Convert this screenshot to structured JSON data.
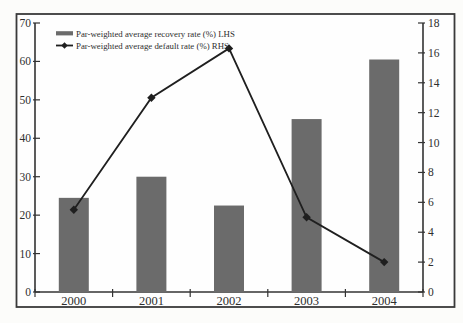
{
  "figure": {
    "background": "#fefefe",
    "page_background": "#fcfcfa",
    "border_color": "#3a3a3a",
    "text_color": "#2e2e2e"
  },
  "chart_data": {
    "type": "bar",
    "subtype": "bar+line dual-axis",
    "categories": [
      "2000",
      "2001",
      "2002",
      "2003",
      "2004"
    ],
    "series": [
      {
        "name": "Par-weighted average recovery rate (%) LHS",
        "type": "bar",
        "axis": "left",
        "color": "#6b6b6b",
        "values": [
          24.5,
          30,
          22.5,
          45,
          60.5
        ]
      },
      {
        "name": "Par-weighted average default rate (%) RHS",
        "type": "line",
        "axis": "right",
        "color": "#1f1f1f",
        "marker": "diamond",
        "values": [
          5.5,
          13,
          16.3,
          5,
          2
        ]
      }
    ],
    "left_axis": {
      "min": 0,
      "max": 70,
      "step": 10,
      "ticks": [
        "0",
        "10",
        "20",
        "30",
        "40",
        "50",
        "60",
        "70"
      ]
    },
    "right_axis": {
      "min": 0,
      "max": 18,
      "step": 2,
      "ticks": [
        "0",
        "2",
        "4",
        "6",
        "8",
        "10",
        "12",
        "14",
        "16",
        "18"
      ]
    },
    "title": "",
    "xlabel": "",
    "ylabel_left": "",
    "ylabel_right": "",
    "grid": false,
    "legend_position": "top-left"
  }
}
